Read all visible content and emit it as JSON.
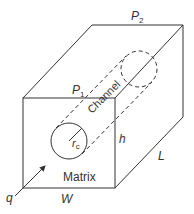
{
  "diagram": {
    "type": "3d-block-with-channel",
    "labels": {
      "p2": "P",
      "p2_sub": "2",
      "p1": "P",
      "p1_sub": "1",
      "channel": "Channel",
      "radius": "r",
      "radius_sub": "c",
      "height": "h",
      "length": "L",
      "width": "W",
      "matrix": "Matrix",
      "flow": "q"
    },
    "colors": {
      "stroke": "#333333",
      "background": "#ffffff"
    }
  }
}
